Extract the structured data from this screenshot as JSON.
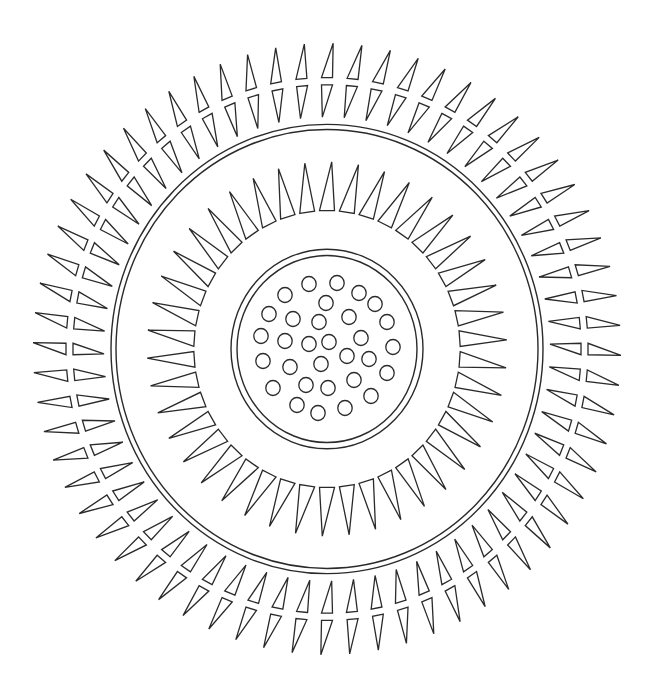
{
  "artwork": {
    "type": "mandala-line-art",
    "background_color": "#ffffff",
    "stroke_color": "#2a2a2a",
    "center": [
      327,
      349
    ],
    "y_scale": 1.04,
    "outer_spike_ring": {
      "count": 64,
      "outer_triangle": {
        "base_radius": 261,
        "tip_radius": 294,
        "half_width": 5.5
      },
      "inner_triangle": {
        "base_radius": 254,
        "tip_radius": 223,
        "half_width": 5.5
      },
      "skew_deg": 1.2
    },
    "outer_double_ring": {
      "radii": [
        216,
        211
      ]
    },
    "inner_spike_ring": {
      "count": 42,
      "base_radius": 133,
      "tip_radius": 180,
      "half_width": 7.5,
      "skew_deg": 1.5
    },
    "inner_double_ring": {
      "radii": [
        96,
        90
      ]
    },
    "dots": {
      "radius": 7.2,
      "positions": [
        [
          309,
          284
        ],
        [
          337,
          283
        ],
        [
          285,
          295
        ],
        [
          359,
          293
        ],
        [
          375,
          304
        ],
        [
          326,
          303
        ],
        [
          269,
          314
        ],
        [
          293,
          319
        ],
        [
          319,
          322
        ],
        [
          349,
          317
        ],
        [
          387,
          322
        ],
        [
          261,
          336
        ],
        [
          285,
          341
        ],
        [
          309,
          344
        ],
        [
          329,
          342
        ],
        [
          361,
          338
        ],
        [
          393,
          347
        ],
        [
          263,
          361
        ],
        [
          290,
          367
        ],
        [
          321,
          364
        ],
        [
          347,
          356
        ],
        [
          369,
          359
        ],
        [
          387,
          373
        ],
        [
          273,
          388
        ],
        [
          306,
          385
        ],
        [
          328,
          388
        ],
        [
          354,
          380
        ],
        [
          371,
          396
        ],
        [
          297,
          405
        ],
        [
          318,
          413
        ],
        [
          345,
          408
        ]
      ]
    }
  }
}
